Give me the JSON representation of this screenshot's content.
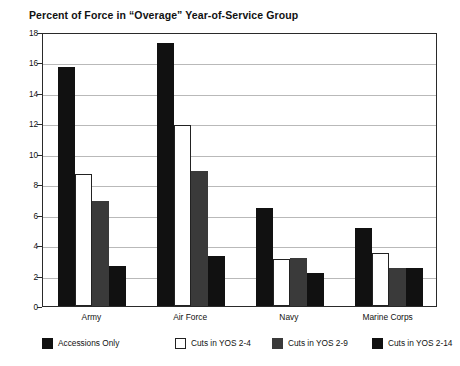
{
  "chart_data": {
    "type": "bar",
    "title": "Percent of Force in “Overage” Year-of-Service Group",
    "xlabel": "",
    "ylabel": "",
    "ylim": [
      0,
      18
    ],
    "yticks": [
      0,
      2,
      4,
      6,
      8,
      10,
      12,
      14,
      16,
      18
    ],
    "grid": true,
    "legend_position": "bottom",
    "categories": [
      "Army",
      "Air Force",
      "Navy",
      "Marine Corps"
    ],
    "series": [
      {
        "name": "Accessions Only",
        "color": "#111111",
        "values": [
          15.7,
          17.3,
          6.45,
          5.1
        ]
      },
      {
        "name": "Cuts in YOS 2-4",
        "color": "#ffffff",
        "values": [
          8.7,
          11.9,
          3.1,
          3.5
        ]
      },
      {
        "name": "Cuts in YOS 2-9",
        "color": "#3a3a3a",
        "values": [
          6.9,
          8.9,
          3.15,
          2.5
        ]
      },
      {
        "name": "Cuts in YOS 2-14",
        "color": "#111111",
        "values": [
          2.65,
          3.3,
          2.2,
          2.5
        ]
      }
    ]
  }
}
